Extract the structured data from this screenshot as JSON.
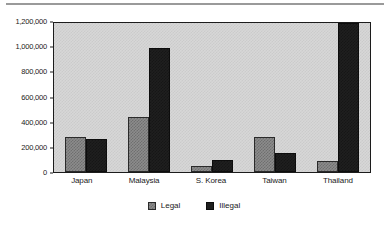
{
  "chart_data": {
    "type": "bar",
    "title": "",
    "subtitle": "",
    "xlabel": "",
    "ylabel": "",
    "categories": [
      "Japan",
      "Malaysia",
      "S. Korea",
      "Taiwan",
      "Thailand"
    ],
    "series": [
      {
        "name": "Legal",
        "color": "#8c8c8c",
        "values": [
          285000,
          440000,
          50000,
          285000,
          90000
        ]
      },
      {
        "name": "Illegal",
        "color": "#1f1f1f",
        "values": [
          265000,
          995000,
          95000,
          150000,
          1200000
        ]
      }
    ],
    "ylim": [
      0,
      1200000
    ],
    "ytick_values": [
      0,
      200000,
      400000,
      600000,
      800000,
      1000000,
      1200000
    ],
    "ytick_labels": [
      "0",
      "200,000",
      "400,000",
      "600,000",
      "800,000",
      "1,000,000",
      "1,200,000"
    ],
    "grid": false,
    "legend_position": "bottom-center"
  },
  "legend": {
    "items": [
      {
        "label": "Legal"
      },
      {
        "label": "Illegal"
      }
    ]
  }
}
